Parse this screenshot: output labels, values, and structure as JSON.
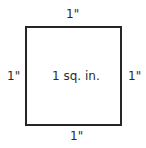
{
  "diagram": {
    "shape": "square",
    "area_label": "1 sq. in.",
    "side_labels": {
      "top": "1\"",
      "bottom": "1\"",
      "left": "1\"",
      "right": "1\""
    },
    "stroke_color": "#262626",
    "text_color": "#2a2a2a"
  }
}
